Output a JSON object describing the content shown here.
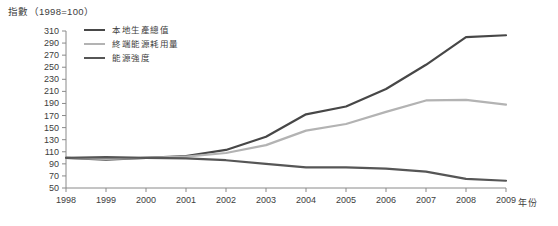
{
  "title": "指數（1998=100）",
  "x_axis_unit": "年份",
  "chart_data": {
    "type": "line",
    "title": "指數（1998=100）",
    "xlabel": "年份",
    "ylabel": "指數",
    "x": [
      1998,
      1999,
      2000,
      2001,
      2002,
      2003,
      2004,
      2005,
      2006,
      2007,
      2008,
      2009
    ],
    "ylim": [
      50,
      310
    ],
    "ytick_step": 20,
    "grid": false,
    "legend_position": "top-left-inside",
    "axis_color": "#8a8a8a",
    "text_color": "#3d3d3d",
    "series": [
      {
        "name": "本地生產總值",
        "color": "#474747",
        "values": [
          100,
          97,
          100,
          103,
          113,
          135,
          172,
          185,
          214,
          254,
          300,
          303
        ]
      },
      {
        "name": "終端能源耗用量",
        "color": "#b3b3b3",
        "values": [
          100,
          98,
          100,
          102,
          108,
          121,
          145,
          156,
          176,
          195,
          196,
          188
        ]
      },
      {
        "name": "能源強度",
        "color": "#565656",
        "values": [
          100,
          101,
          100,
          99,
          96,
          90,
          84,
          84,
          82,
          77,
          65,
          62
        ]
      }
    ]
  }
}
